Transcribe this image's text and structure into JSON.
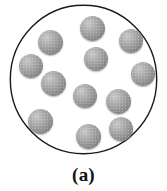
{
  "figure": {
    "caption": "(a)",
    "kind": "particle-container-diagram",
    "colors": {
      "background": "#fefefe",
      "outline": "#1a1a1a",
      "particle_light": "#c9c9c9",
      "particle_mid": "#9d9d9d",
      "particle_dark": "#757575"
    },
    "container": {
      "shape": "circle",
      "center_x": 84,
      "center_y": 80,
      "radius_x": 74,
      "radius_y": 75,
      "stroke_width": 1.4
    },
    "particle_count": 12,
    "particle_diameter": 24,
    "particles": [
      {
        "id": 1,
        "cx": 92,
        "cy": 28,
        "d": 25
      },
      {
        "id": 2,
        "cx": 50,
        "cy": 42,
        "d": 25
      },
      {
        "id": 3,
        "cx": 131,
        "cy": 41,
        "d": 24
      },
      {
        "id": 4,
        "cx": 96,
        "cy": 59,
        "d": 24
      },
      {
        "id": 5,
        "cx": 31,
        "cy": 66,
        "d": 24
      },
      {
        "id": 6,
        "cx": 143,
        "cy": 74,
        "d": 24
      },
      {
        "id": 7,
        "cx": 53,
        "cy": 83,
        "d": 25
      },
      {
        "id": 8,
        "cx": 85,
        "cy": 96,
        "d": 24
      },
      {
        "id": 9,
        "cx": 118,
        "cy": 101,
        "d": 25
      },
      {
        "id": 10,
        "cx": 40,
        "cy": 121,
        "d": 25
      },
      {
        "id": 11,
        "cx": 121,
        "cy": 129,
        "d": 24
      },
      {
        "id": 12,
        "cx": 88,
        "cy": 136,
        "d": 25
      }
    ]
  }
}
